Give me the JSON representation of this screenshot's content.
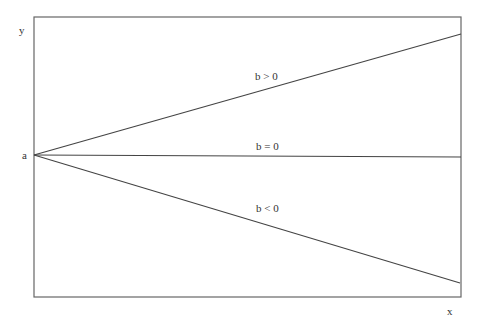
{
  "diagram": {
    "title": "",
    "axis_labels": {
      "y": "y",
      "x": "x",
      "origin": "a"
    },
    "lines": [
      {
        "label": "b > 0",
        "x1": 34,
        "y1": 155,
        "x2": 461,
        "y2": 34
      },
      {
        "label": "b = 0",
        "x1": 34,
        "y1": 155,
        "x2": 461,
        "y2": 157
      },
      {
        "label": "b < 0",
        "x1": 34,
        "y1": 155,
        "x2": 460,
        "y2": 283
      }
    ],
    "colors": {
      "line": "#444444",
      "frame": "#666666",
      "text": "#333333"
    }
  }
}
